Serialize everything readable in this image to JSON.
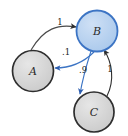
{
  "diagram": {
    "background": "#ffffff",
    "nodes": [
      {
        "id": "A",
        "label": "A",
        "cx": 33,
        "cy": 71,
        "r": 20.5,
        "fill": "#d4d4d4",
        "stroke": "#2e2e2e",
        "highlighted": false
      },
      {
        "id": "B",
        "label": "B",
        "cx": 97,
        "cy": 31,
        "r": 20.5,
        "fill": "#b9d2ef",
        "stroke": "#3c74c4",
        "highlighted": true
      },
      {
        "id": "C",
        "label": "C",
        "cx": 94,
        "cy": 112,
        "r": 20,
        "fill": "#d4d4d4",
        "stroke": "#2e2e2e",
        "highlighted": false
      }
    ],
    "edges": [
      {
        "id": "A-to-B",
        "from": "A",
        "to": "B",
        "label": "1",
        "label_x": 60,
        "label_y": 22,
        "color": "#4a4a4a",
        "path": "M 31,50 C 44,28 58,24 76,27",
        "arrow": "dark"
      },
      {
        "id": "B-to-A",
        "from": "B",
        "to": "A",
        "label": ".1",
        "label_x": 66,
        "label_y": 52,
        "color": "#3c74c4",
        "path": "M 94,52 C 82,64 68,68 54,68",
        "arrow": "blue"
      },
      {
        "id": "B-to-C",
        "from": "B",
        "to": "C",
        "label": ".9",
        "label_x": 83,
        "label_y": 70,
        "color": "#3c74c4",
        "path": "M 91,51 C 85,70 82,82 80,95",
        "arrow": "blue"
      },
      {
        "id": "C-to-B",
        "from": "C",
        "to": "B",
        "label": "1",
        "label_x": 110,
        "label_y": 69,
        "color": "#2e2e2e",
        "path": "M 107,95 C 114,80 112,62 104,50",
        "arrow": "dark"
      }
    ]
  }
}
